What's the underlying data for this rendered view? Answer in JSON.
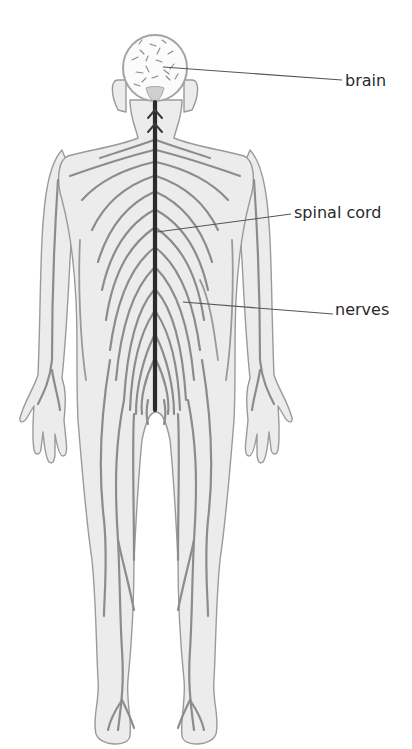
{
  "diagram": {
    "labels": [
      {
        "id": "brain",
        "text": "brain",
        "x": 345,
        "y": 73,
        "line": {
          "x1": 163,
          "y1": 67,
          "x2": 342,
          "y2": 80
        }
      },
      {
        "id": "spinal_cord",
        "text": "spinal cord",
        "x": 294,
        "y": 205,
        "line": {
          "x1": 157,
          "y1": 232,
          "x2": 291,
          "y2": 214
        }
      },
      {
        "id": "nerves",
        "text": "nerves",
        "x": 335,
        "y": 302,
        "line": {
          "x1": 183,
          "y1": 302,
          "x2": 333,
          "y2": 314
        }
      }
    ],
    "colors": {
      "body_fill": "#ececec",
      "outline": "#9a9a9a",
      "nerve": "#8c8c8c",
      "spinal_cord": "#2b2b2b",
      "label_text": "#2a2a2a"
    }
  }
}
